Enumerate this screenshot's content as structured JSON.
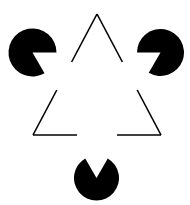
{
  "figure": {
    "name": "Kanizsa triangle illusion",
    "canvas": {
      "width": 190,
      "height": 205
    },
    "background_color": "#ffffff",
    "ink_color": "#000000"
  },
  "chart_data": {
    "type": "scatter",
    "xlabel": "",
    "ylabel": "",
    "xlim": [
      0,
      190
    ],
    "ylim": [
      0,
      205
    ],
    "grid": false,
    "legend": "none",
    "series": [
      {
        "name": "pacman-discs",
        "values": [
          {
            "id": "disc-top-left",
            "cx": 32.5,
            "cy": 52.5,
            "r": 24.0,
            "notch_start_deg": 0,
            "notch_end_deg": 60,
            "fill": "#000000"
          },
          {
            "id": "disc-top-right",
            "cx": 160.5,
            "cy": 52.5,
            "r": 23.5,
            "notch_start_deg": 120,
            "notch_end_deg": 180,
            "fill": "#000000"
          },
          {
            "id": "disc-bottom",
            "cx": 96.5,
            "cy": 178.0,
            "r": 22.5,
            "notch_start_deg": 240,
            "notch_end_deg": 300,
            "fill": "#000000"
          }
        ]
      },
      {
        "name": "outline-triangle",
        "values": [
          {
            "id": "apex-top",
            "x": 97,
            "y": 14
          },
          {
            "id": "corner-bottom-left",
            "x": 33,
            "y": 135
          },
          {
            "id": "corner-bottom-right",
            "x": 161,
            "y": 135
          }
        ],
        "stroke": "#000000",
        "stroke_width": 1.6,
        "gaps": [
          {
            "edge": "left",
            "from_y": 62,
            "to_y": 90
          },
          {
            "edge": "right",
            "from_y": 62,
            "to_y": 90
          },
          {
            "edge": "bottom",
            "from_x": 77,
            "to_x": 117
          }
        ]
      },
      {
        "name": "illusory-triangle",
        "values": [
          {
            "id": "illusory-apex",
            "x": 97,
            "y": 29
          },
          {
            "id": "illusory-left",
            "x": 33,
            "y": 150
          },
          {
            "id": "illusory-right",
            "x": 161,
            "y": 150
          }
        ],
        "fill": "#ffffff",
        "note": "perceived, not drawn"
      }
    ]
  }
}
